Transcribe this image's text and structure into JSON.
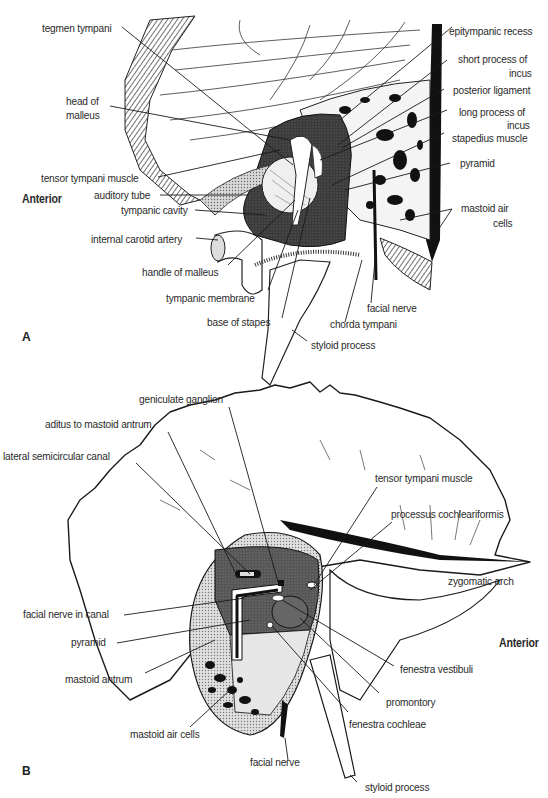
{
  "figure": {
    "panels": [
      {
        "id": "A",
        "letter": "A",
        "orientation_label": "Anterior",
        "labels": {
          "tegmen_tympani": "tegmen tympani",
          "head_of_malleus_1": "head of",
          "head_of_malleus_2": "malleus",
          "tensor_tympani_muscle": "tensor tympani muscle",
          "auditory_tube": "auditory tube",
          "tympanic_cavity": "tympanic cavity",
          "internal_carotid_artery": "internal carotid artery",
          "handle_of_malleus": "handle of malleus",
          "tympanic_membrane": "tympanic membrane",
          "base_of_stapes": "base of stapes",
          "epitympanic_recess": "epitympanic recess",
          "short_process_of_incus_1": "short process of",
          "short_process_of_incus_2": "incus",
          "posterior_ligament": "posterior ligament",
          "long_process_of_incus_1": "long process of",
          "long_process_of_incus_2": "incus",
          "stapedius_muscle": "stapedius muscle",
          "pyramid": "pyramid",
          "mastoid_air_cells_1": "mastoid air",
          "mastoid_air_cells_2": "cells",
          "facial_nerve": "facial nerve",
          "chorda_tympani": "chorda tympani",
          "styloid_process": "styloid process"
        }
      },
      {
        "id": "B",
        "letter": "B",
        "orientation_label": "Anterior",
        "labels": {
          "geniculate_ganglion": "geniculate ganglion",
          "aditus_to_mastoid_antrum": "aditus to mastoid antrum",
          "lateral_semicircular_canal": "lateral semicircular canal",
          "tensor_tympani_muscle": "tensor tympani muscle",
          "processus_cochleariformis": "processus cochleariformis",
          "zygomatic_arch": "zygomatic arch",
          "facial_nerve_in_canal": "facial nerve in canal",
          "pyramid": "pyramid",
          "mastoid_antrum": "mastoid antrum",
          "mastoid_air_cells": "mastoid air cells",
          "facial_nerve": "facial nerve",
          "fenestra_vestibuli": "fenestra vestibuli",
          "promontory": "promontory",
          "fenestra_cochleae": "fenestra cochleae",
          "styloid_process": "styloid process"
        }
      }
    ],
    "colors": {
      "ink": "#1a1a1a",
      "dark_fill": "#2b2b2b",
      "mid_fill": "#6e6e6e",
      "light_fill": "#c8c8c8",
      "background": "#ffffff"
    }
  }
}
